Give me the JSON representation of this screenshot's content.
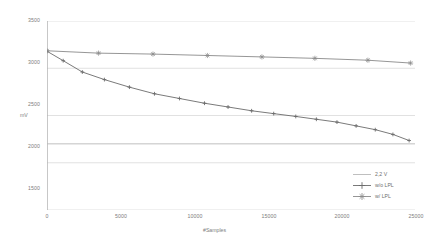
{
  "chart_data": {
    "type": "line",
    "title": "",
    "xlabel": "#Samples",
    "ylabel": "mV",
    "xlim": [
      0,
      25000
    ],
    "ylim": [
      1500,
      3500
    ],
    "xticks": [
      "0",
      "5000",
      "10000",
      "15000",
      "20000",
      "25000"
    ],
    "xtick_values": [
      0,
      5000,
      10000,
      15000,
      20000,
      25000
    ],
    "yticks": [
      "3500",
      "3000",
      "2500",
      "2000",
      "1500"
    ],
    "ytick_values": [
      3500,
      3000,
      2500,
      2000,
      1500
    ],
    "grid": "horizontal",
    "legend_position": "bottom-right",
    "series": [
      {
        "name": "2,2 V",
        "marker": "none",
        "color": "#b8b8b8",
        "x": [
          0,
          25000
        ],
        "values": [
          2200,
          2200
        ]
      },
      {
        "name": "w/o LPL",
        "marker": "plus",
        "color": "#6b6b6b",
        "x": [
          0,
          1100,
          2400,
          3900,
          5600,
          7300,
          9000,
          10700,
          12300,
          13900,
          15400,
          16900,
          18300,
          19700,
          21000,
          22300,
          23500,
          24600
        ],
        "values": [
          3180,
          3080,
          2960,
          2880,
          2800,
          2730,
          2680,
          2630,
          2590,
          2550,
          2520,
          2490,
          2460,
          2430,
          2390,
          2350,
          2300,
          2235
        ]
      },
      {
        "name": "w/ LPL",
        "marker": "star",
        "color": "#8a8a8a",
        "x": [
          0,
          3500,
          7200,
          10900,
          14600,
          18200,
          21800,
          24700
        ],
        "values": [
          3185,
          3160,
          3150,
          3135,
          3120,
          3105,
          3085,
          3055
        ]
      }
    ]
  },
  "axes": {
    "y_axis_title": "mV",
    "x_axis_title": "#Samples"
  },
  "legend": {
    "items": [
      {
        "label": "2,2 V",
        "marker": "none"
      },
      {
        "label": "w/o LPL",
        "marker": "plus"
      },
      {
        "label": "w/ LPL",
        "marker": "star"
      }
    ]
  }
}
